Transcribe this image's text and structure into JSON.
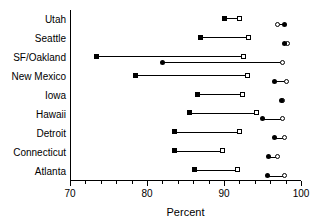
{
  "chart_data": {
    "type": "scatter",
    "title": "",
    "xlabel": "Percent",
    "ylabel": "",
    "xlim": [
      70,
      100
    ],
    "xticks": [
      70,
      80,
      90,
      100
    ],
    "xtick_labels": [
      "70",
      "80",
      "90",
      "100"
    ],
    "minor_tick_step": 2,
    "grid": false,
    "legend": null,
    "categories": [
      "Utah",
      "Seattle",
      "SF/Oakland",
      "New Mexico",
      "Iowa",
      "Hawaii",
      "Detroit",
      "Connecticut",
      "Atlanta"
    ],
    "series": [
      {
        "name": "square-pair",
        "marker_start": "sq-filled",
        "marker_end": "sq-open",
        "start_values": [
          90.0,
          87.0,
          73.5,
          78.5,
          86.5,
          85.5,
          83.6,
          83.6,
          86.2
        ],
        "end_values": [
          92.0,
          93.2,
          92.5,
          93.0,
          92.4,
          94.2,
          92.0,
          89.8,
          91.7
        ]
      },
      {
        "name": "circle-pair",
        "marker_start": "ci-open",
        "marker_end": "ci-filled",
        "start_values": [
          97.0,
          97.8,
          82.0,
          96.5,
          97.5,
          95.0,
          96.5,
          95.8,
          95.6
        ],
        "end_values": [
          97.8,
          98.3,
          97.6,
          98.1,
          97.6,
          97.6,
          97.9,
          97.0,
          97.8
        ],
        "orientation": [
          "open-left",
          "filled-left",
          "filled-left",
          "filled-left",
          "overlap",
          "filled-left",
          "filled-left",
          "filled-left",
          "filled-left"
        ]
      }
    ]
  },
  "axis": {
    "x_title": "Percent",
    "tick_70": "70",
    "tick_80": "80",
    "tick_90": "90",
    "tick_100": "100"
  },
  "labels": {
    "utah": "Utah",
    "seattle": "Seattle",
    "sf_oakland": "SF/Oakland",
    "new_mexico": "New Mexico",
    "iowa": "Iowa",
    "hawaii": "Hawaii",
    "detroit": "Detroit",
    "connecticut": "Connecticut",
    "atlanta": "Atlanta"
  }
}
